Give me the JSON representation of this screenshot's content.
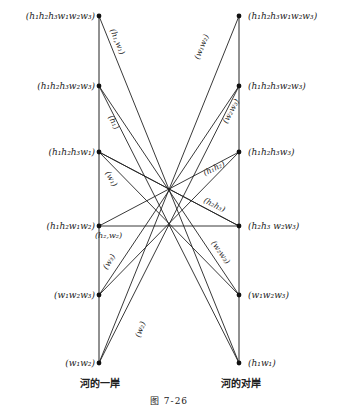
{
  "figure": {
    "caption": "图   7-26",
    "left_bank_label": "河的一岸",
    "right_bank_label": "河的对岸"
  },
  "left_states": [
    {
      "id": "L0",
      "label": "(h₁h₂h₃w₁w₂w₃)",
      "y": 16
    },
    {
      "id": "L1",
      "label": "(h₁h₂h₃w₂w₃)",
      "y": 86
    },
    {
      "id": "L2",
      "label": "(h₁h₂h₃w₁)",
      "y": 152
    },
    {
      "id": "L3",
      "label": "(h₁h₂w₁w₂)",
      "y": 226
    },
    {
      "id": "L4",
      "label": "(w₁w₂w₃)",
      "y": 295
    },
    {
      "id": "L5",
      "label": "(w₁w₂)",
      "y": 363
    }
  ],
  "right_states": [
    {
      "id": "R0",
      "label": "(h₁h₂h₃w₁w₂w₃)",
      "y": 16
    },
    {
      "id": "R1",
      "label": "(h₁h₂h₃w₂w₃)",
      "y": 86
    },
    {
      "id": "R2",
      "label": "(h₁h₂h₃w₃)",
      "y": 152
    },
    {
      "id": "R3",
      "label": "(h₂h₃ w₂w₃)",
      "y": 226
    },
    {
      "id": "R4",
      "label": "(w₁w₂w₃)",
      "y": 295
    },
    {
      "id": "R5",
      "label": "(h₁w₁)",
      "y": 363
    }
  ],
  "edges": [
    {
      "from": "L0",
      "to": "R5",
      "label": "(h₁,w₁)"
    },
    {
      "from": "L1",
      "to": "R5",
      "label": "(h₁)"
    },
    {
      "from": "L1",
      "to": "R4",
      "label": ""
    },
    {
      "from": "L2",
      "to": "R4",
      "label": "(w₁)"
    },
    {
      "from": "L2",
      "to": "R3",
      "label": ""
    },
    {
      "from": "L3",
      "to": "R3",
      "label": "(h₂,w₂)"
    },
    {
      "from": "L3",
      "to": "R2",
      "label": ""
    },
    {
      "from": "R0",
      "to": "L5",
      "label": "(w₁w₂)"
    },
    {
      "from": "R1",
      "to": "L5",
      "label": "(w₂)"
    },
    {
      "from": "R1",
      "to": "L4",
      "label": "(w₂w₃)"
    },
    {
      "from": "R2",
      "to": "L4",
      "label": "(w₃)"
    },
    {
      "from": "R2",
      "to": "L3",
      "label": "(h₁h₂)"
    },
    {
      "from": "R3",
      "to": "L2",
      "label": "(h₂h₃)"
    },
    {
      "from": "R3",
      "to": "L4",
      "label": "(w₂w₃)"
    }
  ]
}
